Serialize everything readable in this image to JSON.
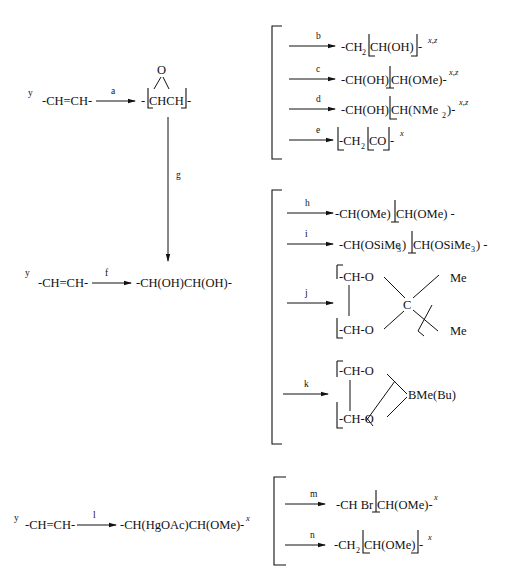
{
  "scheme": {
    "row1": {
      "y_label": "y",
      "reactant": "-CH=CH-",
      "arrow_a": "a",
      "epoxide_o": "O",
      "epoxide_dash_left": "-",
      "epoxide_body": "CHCH",
      "epoxide_dash_right": "-"
    },
    "branch1": {
      "b": {
        "arrow": "b",
        "p1": "-CH",
        "sub1": "2",
        "p2": "CH(OH)",
        "p3": "-",
        "sup": "x,z"
      },
      "c": {
        "arrow": "c",
        "p1": "-CH(OH)",
        "p2": "CH(OMe)-",
        "sup": "x,z"
      },
      "d": {
        "arrow": "d",
        "p1": "-CH(OH)",
        "p2": "CH(NMe",
        "sub2": "2",
        "p3": ")-",
        "sup": "x,z"
      },
      "e": {
        "arrow": "e",
        "p1": "-CH",
        "sub1": "2",
        "p2": "CO",
        "p3": "-",
        "sup": "x"
      }
    },
    "arrow_g": "g",
    "row2": {
      "y_label": "y",
      "reactant": "-CH=CH-",
      "arrow_f": "f",
      "product": "-CH(OH)CH(OH)-"
    },
    "branch2": {
      "h": {
        "arrow": "h",
        "p1": "-CH(OMe)",
        "p2": "CH(OMe) -"
      },
      "i": {
        "arrow": "i",
        "p1": "-CH(OSiMe",
        "sub1": "3",
        "p2": ")",
        "p3": "CH(OSiMe",
        "sub2": "3",
        "p4": ") -"
      },
      "j": {
        "arrow": "j",
        "top": "-CH-O",
        "bottom": "-CH-O",
        "center": "C",
        "me_top": "Me",
        "me_bottom": "Me"
      },
      "k": {
        "arrow": "k",
        "top": "-CH-O",
        "bottom": "-CH-O",
        "boron": "BMe(Bu)"
      }
    },
    "row3": {
      "y_label": "y",
      "reactant": "-CH=CH-",
      "arrow_l": "l",
      "product": "-CH(HgOAc)CH(OMe)-",
      "sup": "x"
    },
    "branch3": {
      "m": {
        "arrow": "m",
        "p1": "-CH Br",
        "p2": "CH(OMe)-",
        "sup": "x"
      },
      "n": {
        "arrow": "n",
        "p1": "-CH",
        "sub1": "2",
        "p2": "CH(OMe)",
        "p3": "-",
        "sup": "x"
      }
    }
  }
}
